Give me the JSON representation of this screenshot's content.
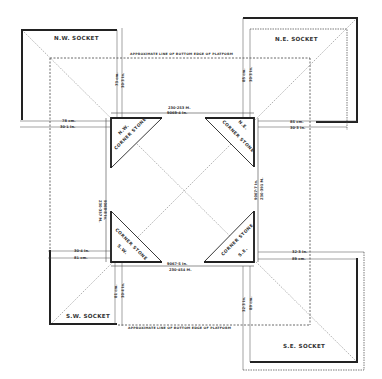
{
  "sockets": {
    "nw": "N.W. SOCKET",
    "ne": "N.E. SOCKET",
    "sw": "S.W. SOCKET",
    "se": "S.E. SOCKET"
  },
  "corner_stones": {
    "nw": {
      "label": "CORNER STONE",
      "corner": "N.W."
    },
    "ne": {
      "label": "CORNER STONE",
      "corner": "N.E."
    },
    "sw": {
      "label": "CORNER STONE",
      "corner": "S.W."
    },
    "se": {
      "label": "CORNER STONE",
      "corner": "S.E."
    }
  },
  "platform_notes": {
    "top": "APPROXIMATE LINE OF BOTTOM EDGE OF PLATFORM",
    "bottom": "APPROXIMATE LINE OF BOTTOM EDGE OF PLATFORM"
  },
  "side_dimensions": {
    "north": {
      "metric": "230·253 M.",
      "imperial": "9069·4 In."
    },
    "south": {
      "metric": "230·454 M.",
      "imperial": "9067·5 In."
    },
    "west": {
      "metric": "230·357 M.",
      "imperial": "9068·8 In."
    },
    "east": {
      "metric": "230·391 M.",
      "imperial": "9067·7 In."
    }
  },
  "socket_dimensions": {
    "nw_horizontal": {
      "metric": "78 cm.",
      "imperial": "30·1 In."
    },
    "nw_vertical": {
      "metric": "73 cm.",
      "imperial": "30·3 In."
    },
    "ne_horizontal": {
      "metric": "85 cm.",
      "imperial": "30·3 In."
    },
    "ne_vertical": {
      "metric": "85 cm.",
      "imperial": "30·3 In."
    },
    "sw_horizontal": {
      "metric": "81 cm.",
      "imperial": "30·4 In."
    },
    "sw_vertical": {
      "metric": "81 cm.",
      "imperial": "30·4 In."
    },
    "se_horizontal": {
      "metric": "89 cm.",
      "imperial": "32·3 In."
    },
    "se_vertical": {
      "metric": "89 cm.",
      "imperial": "32·3 In."
    }
  },
  "colors": {
    "ink": "#333333",
    "paper": "#ffffff"
  }
}
